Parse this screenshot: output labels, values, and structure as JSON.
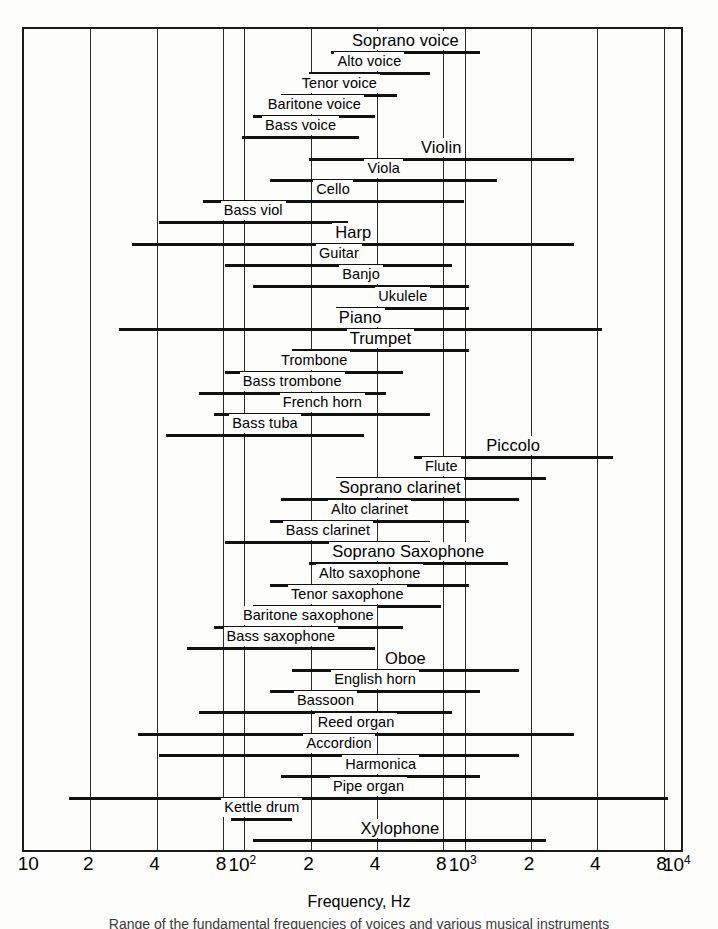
{
  "chart_data": {
    "type": "bar",
    "title": "",
    "xlabel": "Frequency, Hz",
    "ylabel": "",
    "xscale": "log",
    "xlim": [
      10,
      10000
    ],
    "grid": true,
    "legend": null,
    "xticks": [
      {
        "value": 10,
        "label": "10",
        "sup": ""
      },
      {
        "value": 20,
        "label": "2",
        "sup": ""
      },
      {
        "value": 40,
        "label": "4",
        "sup": ""
      },
      {
        "value": 80,
        "label": "8",
        "sup": ""
      },
      {
        "value": 100,
        "label": "10",
        "sup": "2"
      },
      {
        "value": 200,
        "label": "2",
        "sup": ""
      },
      {
        "value": 400,
        "label": "4",
        "sup": ""
      },
      {
        "value": 800,
        "label": "8",
        "sup": ""
      },
      {
        "value": 1000,
        "label": "10",
        "sup": "3"
      },
      {
        "value": 2000,
        "label": "2",
        "sup": ""
      },
      {
        "value": 4000,
        "label": "4",
        "sup": ""
      },
      {
        "value": 8000,
        "label": "8",
        "sup": ""
      },
      {
        "value": 10000,
        "label": "10",
        "sup": "4"
      }
    ],
    "gridlines": [
      10,
      20,
      40,
      80,
      100,
      200,
      400,
      800,
      1000,
      2000,
      4000,
      8000,
      10000
    ],
    "ranges": [
      {
        "name": "Soprano voice",
        "min": 247,
        "max": 1175,
        "label_size": "big"
      },
      {
        "name": "Alto voice",
        "min": 196,
        "max": 698,
        "label_size": "normal"
      },
      {
        "name": "Tenor voice",
        "min": 147,
        "max": 494,
        "label_size": "normal"
      },
      {
        "name": "Baritone voice",
        "min": 110,
        "max": 392,
        "label_size": "normal"
      },
      {
        "name": "Bass voice",
        "min": 98,
        "max": 330,
        "label_size": "normal"
      },
      {
        "name": "Violin",
        "min": 196,
        "max": 3136,
        "label_size": "big"
      },
      {
        "name": "Viola",
        "min": 131,
        "max": 1397,
        "label_size": "normal"
      },
      {
        "name": "Cello",
        "min": 65,
        "max": 988,
        "label_size": "normal"
      },
      {
        "name": "Bass viol",
        "min": 41,
        "max": 294,
        "label_size": "normal"
      },
      {
        "name": "Harp",
        "min": 31,
        "max": 3136,
        "label_size": "big"
      },
      {
        "name": "Guitar",
        "min": 82,
        "max": 880,
        "label_size": "normal"
      },
      {
        "name": "Banjo",
        "min": 110,
        "max": 1047,
        "label_size": "normal"
      },
      {
        "name": "Ukulele",
        "min": 262,
        "max": 1047,
        "label_size": "normal"
      },
      {
        "name": "Piano",
        "min": 27,
        "max": 4186,
        "label_size": "big"
      },
      {
        "name": "Trumpet",
        "min": 165,
        "max": 1047,
        "label_size": "big"
      },
      {
        "name": "Trombone",
        "min": 82,
        "max": 523,
        "label_size": "normal"
      },
      {
        "name": "Bass trombone",
        "min": 62,
        "max": 440,
        "label_size": "normal"
      },
      {
        "name": "French horn",
        "min": 73,
        "max": 698,
        "label_size": "normal"
      },
      {
        "name": "Bass tuba",
        "min": 44,
        "max": 349,
        "label_size": "normal"
      },
      {
        "name": "Piccolo",
        "min": 587,
        "max": 4699,
        "label_size": "big"
      },
      {
        "name": "Flute",
        "min": 262,
        "max": 2349,
        "label_size": "normal"
      },
      {
        "name": "Soprano  clarinet",
        "min": 147,
        "max": 1760,
        "label_size": "big"
      },
      {
        "name": "Alto clarinet",
        "min": 131,
        "max": 1047,
        "label_size": "normal"
      },
      {
        "name": "Bass clarinet",
        "min": 82,
        "max": 698,
        "label_size": "normal"
      },
      {
        "name": "Soprano  Saxophone",
        "min": 196,
        "max": 1568,
        "label_size": "big"
      },
      {
        "name": "Alto saxophone",
        "min": 131,
        "max": 1047,
        "label_size": "normal"
      },
      {
        "name": "Tenor saxophone",
        "min": 110,
        "max": 784,
        "label_size": "normal"
      },
      {
        "name": "Baritone saxophone",
        "min": 73,
        "max": 523,
        "label_size": "normal"
      },
      {
        "name": "Bass saxophone",
        "min": 55,
        "max": 392,
        "label_size": "normal"
      },
      {
        "name": "Oboe",
        "min": 165,
        "max": 1760,
        "label_size": "big"
      },
      {
        "name": "English horn",
        "min": 131,
        "max": 1175,
        "label_size": "normal"
      },
      {
        "name": "Bassoon",
        "min": 62,
        "max": 880,
        "label_size": "normal"
      },
      {
        "name": "Reed organ",
        "min": 33,
        "max": 3136,
        "label_size": "normal"
      },
      {
        "name": "Accordion",
        "min": 41,
        "max": 1760,
        "label_size": "normal"
      },
      {
        "name": "Harmonica",
        "min": 147,
        "max": 1175,
        "label_size": "normal"
      },
      {
        "name": "Pipe organ",
        "min": 16,
        "max": 8372,
        "label_size": "normal"
      },
      {
        "name": "Kettle drum",
        "min": 87,
        "max": 165,
        "label_size": "normal"
      },
      {
        "name": "Xylophone",
        "min": 110,
        "max": 2349,
        "label_size": "big"
      }
    ]
  },
  "axis": {
    "x_title": "Frequency, Hz"
  },
  "caption": {
    "text": "Range of the fundamental frequencies of voices and various musical instruments"
  }
}
